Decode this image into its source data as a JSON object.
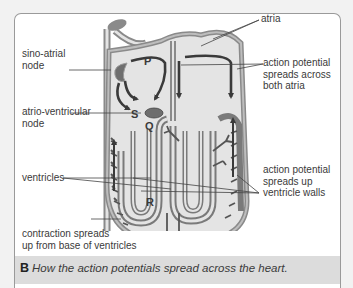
{
  "figure": {
    "letter": "B",
    "caption": "How the action potentials spread across the heart."
  },
  "labels": {
    "left": [
      {
        "id": "sino-atrial-node",
        "lines": [
          "sino-atrial",
          "node"
        ]
      },
      {
        "id": "atrio-ventricular-node",
        "lines": [
          "atrio-ventricular",
          "node"
        ]
      },
      {
        "id": "ventricles",
        "lines": [
          "ventricles"
        ]
      },
      {
        "id": "contraction-spreads",
        "lines": [
          "contraction spreads",
          "up from base of ventricles"
        ]
      }
    ],
    "right": [
      {
        "id": "atria",
        "lines": [
          "atria"
        ]
      },
      {
        "id": "action-potential-atria",
        "lines": [
          "action potential",
          "spreads across",
          "both atria"
        ]
      },
      {
        "id": "action-potential-ventricles",
        "lines": [
          "action potential",
          "spreads up",
          "ventricle walls"
        ]
      }
    ],
    "letters": {
      "P": "P",
      "S": "S",
      "Q": "Q",
      "R": "R"
    }
  },
  "colors": {
    "frame": "#9a9a9a",
    "caption_bg": "#dcdcdc",
    "heart_fill": "#e4e4e4",
    "heart_wall": "#9a9a9a",
    "arrow": "#3a3a3a",
    "node": "#6e6e6e"
  }
}
